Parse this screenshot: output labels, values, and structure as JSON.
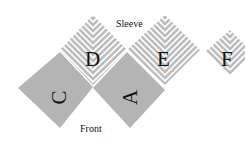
{
  "labels": {
    "sleeve": "Sleeve",
    "front": "Front"
  },
  "pieces": [
    {
      "id": "D",
      "letter": "D",
      "fill": "hatched"
    },
    {
      "id": "E",
      "letter": "E",
      "fill": "hatched"
    },
    {
      "id": "F",
      "letter": "F",
      "fill": "hatched"
    },
    {
      "id": "C",
      "letter": "C",
      "fill": "#b4b4b4"
    },
    {
      "id": "A",
      "letter": "A",
      "fill": "#b4b4b4"
    }
  ],
  "colors": {
    "gray": "#b4b4b4",
    "hatch": "#bdbdbd",
    "text": "#111111"
  }
}
